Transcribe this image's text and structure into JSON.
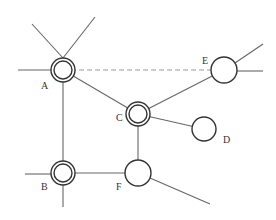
{
  "diagram": {
    "type": "network-graph",
    "colors": {
      "line": "#666666",
      "node_stroke": "#333333",
      "node_fill": "#ffffff",
      "dashed_line": "#999999",
      "label": "#333333"
    },
    "nodes": [
      {
        "id": "A",
        "label": "A",
        "cx": 63,
        "cy": 70,
        "r": 12,
        "double_ring": true,
        "label_x": 41,
        "label_y": 89
      },
      {
        "id": "B",
        "label": "B",
        "cx": 63,
        "cy": 173,
        "r": 12,
        "double_ring": true,
        "label_x": 41,
        "label_y": 190
      },
      {
        "id": "C",
        "label": "C",
        "cx": 138,
        "cy": 114,
        "r": 12,
        "double_ring": true,
        "label_x": 116,
        "label_y": 121
      },
      {
        "id": "D",
        "label": "D",
        "cx": 204,
        "cy": 129,
        "r": 12,
        "double_ring": false,
        "label_x": 223,
        "label_y": 143
      },
      {
        "id": "E",
        "label": "E",
        "cx": 224,
        "cy": 70,
        "r": 13,
        "double_ring": false,
        "label_x": 202,
        "label_y": 64
      },
      {
        "id": "F",
        "label": "F",
        "cx": 138,
        "cy": 173,
        "r": 13,
        "double_ring": false,
        "label_x": 116,
        "label_y": 190
      }
    ],
    "edges": [
      {
        "from": "A",
        "to": "C",
        "style": "solid"
      },
      {
        "from": "A",
        "to": "B",
        "style": "solid"
      },
      {
        "from": "A",
        "to": "E",
        "style": "dashed"
      },
      {
        "from": "C",
        "to": "E",
        "style": "solid"
      },
      {
        "from": "C",
        "to": "D",
        "style": "solid"
      },
      {
        "from": "C",
        "to": "F",
        "style": "solid"
      },
      {
        "from": "B",
        "to": "F",
        "style": "solid"
      }
    ],
    "stub_lines": [
      {
        "node": "A",
        "x1": 32,
        "y1": 24,
        "x2": 63,
        "y2": 58
      },
      {
        "node": "A",
        "x1": 95,
        "y1": 17,
        "x2": 63,
        "y2": 58
      },
      {
        "node": "A",
        "x1": 18,
        "y1": 70,
        "x2": 51,
        "y2": 70
      },
      {
        "node": "B",
        "x1": 25,
        "y1": 174,
        "x2": 51,
        "y2": 174
      },
      {
        "node": "B",
        "x1": 63,
        "y1": 185,
        "x2": 63,
        "y2": 207
      },
      {
        "node": "E",
        "x1": 235,
        "y1": 63,
        "x2": 263,
        "y2": 44
      },
      {
        "node": "E",
        "x1": 237,
        "y1": 71,
        "x2": 263,
        "y2": 71
      },
      {
        "node": "F",
        "x1": 150,
        "y1": 178,
        "x2": 210,
        "y2": 204
      }
    ]
  }
}
